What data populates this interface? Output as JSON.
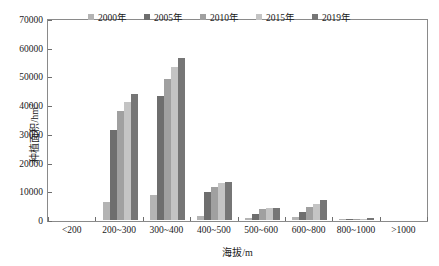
{
  "chart_data": {
    "type": "bar",
    "title": "",
    "xlabel": "海拔/m",
    "ylabel": "种植面积/hm",
    "ylabel_sup": "2",
    "ylim": [
      0,
      70000
    ],
    "ytick_values": [
      0,
      10000,
      20000,
      30000,
      40000,
      50000,
      60000,
      70000
    ],
    "ytick_labels": [
      "0",
      "10000",
      "20000",
      "30000",
      "40000",
      "50000",
      "60000",
      "70000"
    ],
    "grid": false,
    "legend_position": "top-center",
    "categories": [
      "<200",
      "200~300",
      "300~400",
      "400~500",
      "500~600",
      "600~800",
      "800~1000",
      ">1000"
    ],
    "series": [
      {
        "name": "2000年",
        "color": "#b4b4b4",
        "values": [
          0,
          6300,
          8700,
          1400,
          700,
          900,
          200,
          0
        ]
      },
      {
        "name": "2005年",
        "color": "#6e6e6e",
        "values": [
          0,
          31500,
          43200,
          9800,
          2200,
          2800,
          300,
          0
        ]
      },
      {
        "name": "2010年",
        "color": "#a0a0a0",
        "values": [
          0,
          38000,
          49000,
          11500,
          3800,
          4600,
          400,
          0
        ]
      },
      {
        "name": "2015年",
        "color": "#c4c4c4",
        "values": [
          0,
          41000,
          53300,
          13000,
          4300,
          5600,
          500,
          0
        ]
      },
      {
        "name": "2019年",
        "color": "#767676",
        "values": [
          0,
          44000,
          56300,
          13300,
          4300,
          7000,
          600,
          0
        ]
      }
    ]
  },
  "axes": {
    "frame_color": "#8a8a8a",
    "tick_color": "#6e6e6e"
  }
}
